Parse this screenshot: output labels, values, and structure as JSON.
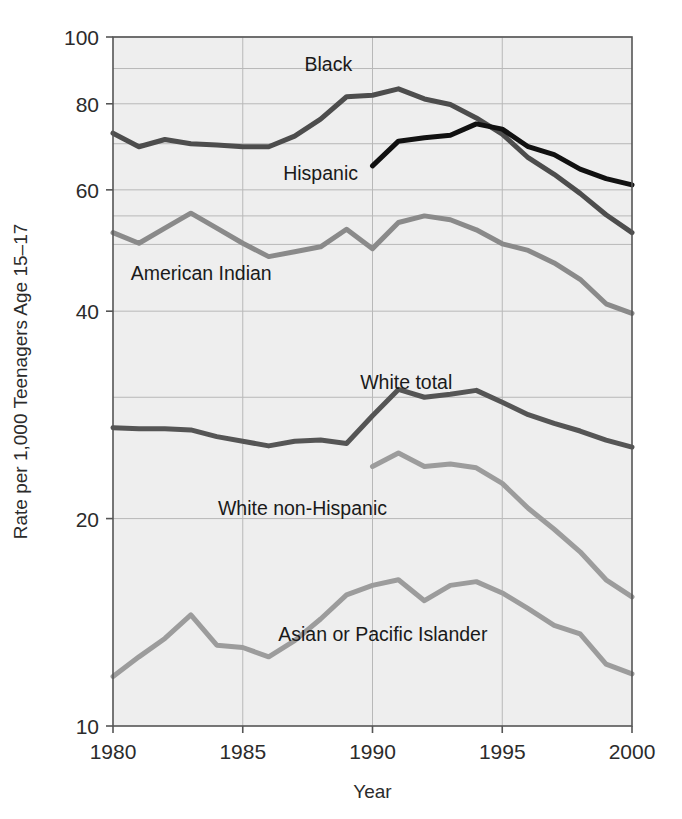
{
  "chart_data": {
    "type": "line",
    "title": "",
    "xlabel": "Year",
    "ylabel": "Rate per 1,000 Teenagers Age 15–17",
    "yscale": "log",
    "ylim": [
      10,
      100
    ],
    "xlim": [
      1980,
      2000
    ],
    "grid": true,
    "legend_position": "inline-annotations",
    "y_ticks": [
      10,
      20,
      40,
      60,
      80,
      100
    ],
    "y_tick_labels": [
      "10",
      "20",
      "40",
      "60",
      "80",
      "100"
    ],
    "y_gridlines": [
      20,
      30,
      40,
      50,
      55,
      60,
      70,
      80,
      90,
      100
    ],
    "x_ticks": [
      1980,
      1985,
      1990,
      1995,
      2000
    ],
    "x_tick_labels": [
      "1980",
      "1985",
      "1990",
      "1995",
      "2000"
    ],
    "x": [
      1980,
      1981,
      1982,
      1983,
      1984,
      1985,
      1986,
      1987,
      1988,
      1989,
      1990,
      1991,
      1992,
      1993,
      1994,
      1995,
      1996,
      1997,
      1998,
      1999,
      2000
    ],
    "series": [
      {
        "name": "Black",
        "color": "#4d4d4d",
        "width": 5,
        "x": [
          1980,
          1981,
          1982,
          1983,
          1984,
          1985,
          1986,
          1987,
          1988,
          1989,
          1990,
          1991,
          1992,
          1993,
          1994,
          1995,
          1996,
          1997,
          1998,
          1999,
          2000
        ],
        "values": [
          72.5,
          69.3,
          71.0,
          70.0,
          69.7,
          69.3,
          69.3,
          71.8,
          76.0,
          81.9,
          82.3,
          84.1,
          81.3,
          79.8,
          76.3,
          72.3,
          66.8,
          63.2,
          59.3,
          55.2,
          52.0
        ],
        "label_text": "Black",
        "label_x": 1988.3,
        "label_y": 91.5
      },
      {
        "name": "Hispanic",
        "color": "#111111",
        "width": 5,
        "x": [
          1990,
          1991,
          1992,
          1993,
          1994,
          1995,
          1996,
          1997,
          1998,
          1999,
          2000
        ],
        "values": [
          65.0,
          70.6,
          71.4,
          72.0,
          74.8,
          73.5,
          69.3,
          67.5,
          64.3,
          62.3,
          61.0
        ],
        "label_text": "Hispanic",
        "label_x": 1988.0,
        "label_y": 63.5
      },
      {
        "name": "American Indian",
        "color": "#8a8a8a",
        "width": 5,
        "x": [
          1980,
          1981,
          1982,
          1983,
          1984,
          1985,
          1986,
          1987,
          1988,
          1989,
          1990,
          1991,
          1992,
          1993,
          1994,
          1995,
          1996,
          1997,
          1998,
          1999,
          2000
        ],
        "values": [
          52.0,
          50.2,
          52.8,
          55.5,
          52.8,
          50.2,
          48.0,
          48.8,
          49.6,
          52.6,
          49.3,
          53.8,
          55.0,
          54.3,
          52.5,
          50.1,
          49.0,
          47.0,
          44.5,
          41.0,
          39.7
        ],
        "label_text": "American Indian",
        "label_x": 1983.4,
        "label_y": 45.5
      },
      {
        "name": "White total",
        "color": "#555555",
        "width": 5,
        "x": [
          1980,
          1981,
          1982,
          1983,
          1984,
          1985,
          1986,
          1987,
          1988,
          1989,
          1990,
          1991,
          1992,
          1993,
          1994,
          1995,
          1996,
          1997,
          1998,
          1999,
          2000
        ],
        "values": [
          27.1,
          27.0,
          27.0,
          26.9,
          26.3,
          25.9,
          25.5,
          25.9,
          26.0,
          25.7,
          28.2,
          30.8,
          30.0,
          30.3,
          30.7,
          29.5,
          28.3,
          27.5,
          26.8,
          26.0,
          25.4
        ],
        "label_text": "White total",
        "label_x": 1991.3,
        "label_y": 31.6
      },
      {
        "name": "White non-Hispanic",
        "color": "#9c9c9c",
        "width": 5,
        "x": [
          1990,
          1991,
          1992,
          1993,
          1994,
          1995,
          1996,
          1997,
          1998,
          1999,
          2000
        ],
        "values": [
          23.8,
          24.9,
          23.8,
          24.0,
          23.7,
          22.5,
          20.7,
          19.3,
          17.9,
          16.3,
          15.4
        ],
        "label_text": "White non-Hispanic",
        "label_x": 1987.3,
        "label_y": 20.7
      },
      {
        "name": "Asian or Pacific Islander",
        "color": "#9c9c9c",
        "width": 5,
        "x": [
          1980,
          1981,
          1982,
          1983,
          1984,
          1985,
          1986,
          1987,
          1988,
          1989,
          1990,
          1991,
          1992,
          1993,
          1994,
          1995,
          1996,
          1997,
          1998,
          1999,
          2000
        ],
        "values": [
          11.8,
          12.6,
          13.4,
          14.5,
          13.1,
          13.0,
          12.6,
          13.3,
          14.3,
          15.5,
          16.0,
          16.3,
          15.2,
          16.0,
          16.2,
          15.6,
          14.8,
          14.0,
          13.6,
          12.3,
          11.9
        ],
        "label_text": "Asian or Pacific Islander",
        "label_x": 1990.4,
        "label_y": 13.6
      }
    ]
  },
  "axes": {
    "x_title": "Year",
    "y_title": "Rate per 1,000 Teenagers Age 15–17"
  },
  "style": {
    "plot_background": "#eeeeee",
    "frame_color": "#555555",
    "grid_color": "#b8b8b8",
    "text_color": "#2b2b2b"
  }
}
